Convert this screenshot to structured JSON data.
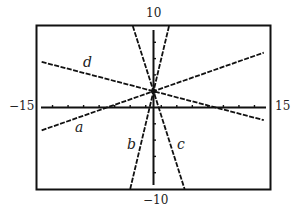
{
  "chart_data": {
    "type": "line",
    "title": "",
    "xlabel": "",
    "ylabel": "",
    "xlim": [
      -15,
      15
    ],
    "ylim": [
      -10,
      10
    ],
    "x_tick_step": 2,
    "y_tick_step": 2,
    "grid": false,
    "legend": "none (inline curve labels)",
    "window_labels": {
      "xmin": "−15",
      "xmax": "15",
      "ymin": "−10",
      "ymax": "10"
    },
    "series": [
      {
        "name": "a",
        "equation": "y = (1/3)x + 2",
        "slope": 0.3333,
        "intercept": 2,
        "x": [
          -14.4,
          14.2
        ],
        "y": [
          -2.8,
          6.73
        ]
      },
      {
        "name": "b",
        "equation": "y = 4x + 2",
        "slope": 4,
        "intercept": 2,
        "x": [
          -3,
          2
        ],
        "y": [
          -10,
          10
        ]
      },
      {
        "name": "c",
        "equation": "y = -3x + 2",
        "slope": -3,
        "intercept": 2,
        "x": [
          -2.667,
          4
        ],
        "y": [
          10,
          -10
        ]
      },
      {
        "name": "d",
        "equation": "y = -(1/4)x + 2",
        "slope": -0.25,
        "intercept": 2,
        "x": [
          -14.4,
          14.2
        ],
        "y": [
          5.6,
          -1.55
        ]
      }
    ],
    "annotations": [
      {
        "text": "a",
        "x": -7.5,
        "y": -3.5
      },
      {
        "text": "b",
        "x": -3.2,
        "y": -7.2
      },
      {
        "text": "c",
        "x": 3.4,
        "y": -7.2
      },
      {
        "text": "d",
        "x": -8.5,
        "y": 6.3
      }
    ],
    "line_style": "dashed (pixelated calculator plot)",
    "color": "#111111"
  },
  "labels": {
    "ymax": "10",
    "ymin": "−10",
    "xmin": "−15",
    "xmax": "15",
    "curve_a": "a",
    "curve_b": "b",
    "curve_c": "c",
    "curve_d": "d"
  }
}
